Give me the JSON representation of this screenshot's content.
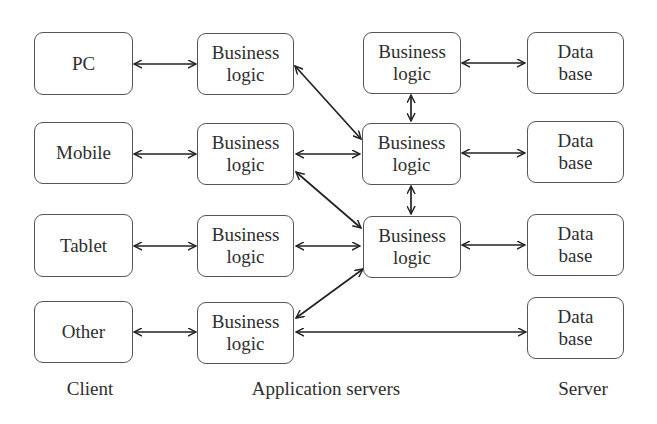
{
  "diagram": {
    "columns": {
      "client": "Client",
      "application_servers": "Application servers",
      "server": "Server"
    },
    "nodes": {
      "pc": "PC",
      "mobile": "Mobile",
      "tablet": "Tablet",
      "other": "Other",
      "bl_client_1": "Business\nlogic",
      "bl_client_2": "Business\nlogic",
      "bl_client_3": "Business\nlogic",
      "bl_client_4": "Business\nlogic",
      "bl_server_1": "Business\nlogic",
      "bl_server_2": "Business\nlogic",
      "bl_server_3": "Business\nlogic",
      "db_1": "Data\nbase",
      "db_2": "Data\nbase",
      "db_3": "Data\nbase",
      "db_4": "Data\nbase"
    },
    "edges": [
      {
        "from": "PC",
        "to": "Business logic (client row 1)",
        "type": "bidirectional"
      },
      {
        "from": "Mobile",
        "to": "Business logic (client row 2)",
        "type": "bidirectional"
      },
      {
        "from": "Tablet",
        "to": "Business logic (client row 3)",
        "type": "bidirectional"
      },
      {
        "from": "Other",
        "to": "Business logic (client row 4)",
        "type": "bidirectional"
      },
      {
        "from": "Business logic (client row 1)",
        "to": "Business logic (server 2)",
        "type": "bidirectional"
      },
      {
        "from": "Business logic (client row 2)",
        "to": "Business logic (server 2)",
        "type": "bidirectional"
      },
      {
        "from": "Business logic (client row 2)",
        "to": "Business logic (server 3)",
        "type": "bidirectional"
      },
      {
        "from": "Business logic (client row 3)",
        "to": "Business logic (server 3)",
        "type": "bidirectional"
      },
      {
        "from": "Business logic (client row 4)",
        "to": "Business logic (server 3)",
        "type": "bidirectional"
      },
      {
        "from": "Business logic (client row 4)",
        "to": "Data base 4",
        "type": "bidirectional"
      },
      {
        "from": "Business logic (server 1)",
        "to": "Business logic (server 2)",
        "type": "bidirectional"
      },
      {
        "from": "Business logic (server 2)",
        "to": "Business logic (server 3)",
        "type": "bidirectional"
      },
      {
        "from": "Business logic (server 1)",
        "to": "Data base 1",
        "type": "bidirectional"
      },
      {
        "from": "Business logic (server 2)",
        "to": "Data base 2",
        "type": "bidirectional"
      },
      {
        "from": "Business logic (server 3)",
        "to": "Data base 3",
        "type": "bidirectional"
      }
    ]
  }
}
